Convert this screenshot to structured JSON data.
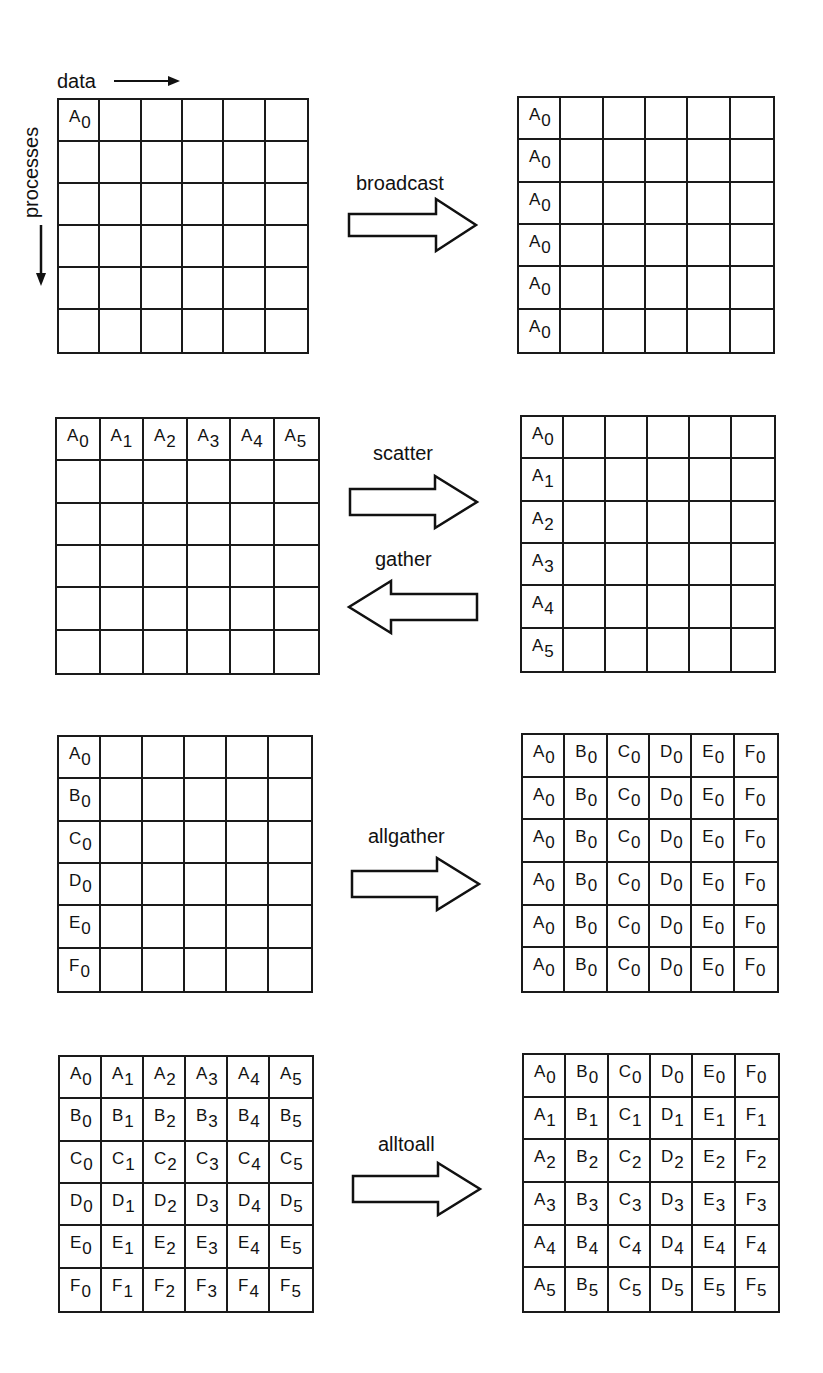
{
  "axes": {
    "data_label": "data",
    "processes_label": "processes"
  },
  "panels": [
    {
      "operation": "broadcast",
      "direction": "right",
      "before": [
        [
          "A0",
          "",
          "",
          "",
          "",
          ""
        ],
        [
          "",
          "",
          "",
          "",
          "",
          ""
        ],
        [
          "",
          "",
          "",
          "",
          "",
          ""
        ],
        [
          "",
          "",
          "",
          "",
          "",
          ""
        ],
        [
          "",
          "",
          "",
          "",
          "",
          ""
        ],
        [
          "",
          "",
          "",
          "",
          "",
          ""
        ]
      ],
      "after": [
        [
          "A0",
          "",
          "",
          "",
          "",
          ""
        ],
        [
          "A0",
          "",
          "",
          "",
          "",
          ""
        ],
        [
          "A0",
          "",
          "",
          "",
          "",
          ""
        ],
        [
          "A0",
          "",
          "",
          "",
          "",
          ""
        ],
        [
          "A0",
          "",
          "",
          "",
          "",
          ""
        ],
        [
          "A0",
          "",
          "",
          "",
          "",
          ""
        ]
      ]
    },
    {
      "operation": "scatter",
      "operation_reverse": "gather",
      "direction": "both",
      "before": [
        [
          "A0",
          "A1",
          "A2",
          "A3",
          "A4",
          "A5"
        ],
        [
          "",
          "",
          "",
          "",
          "",
          ""
        ],
        [
          "",
          "",
          "",
          "",
          "",
          ""
        ],
        [
          "",
          "",
          "",
          "",
          "",
          ""
        ],
        [
          "",
          "",
          "",
          "",
          "",
          ""
        ],
        [
          "",
          "",
          "",
          "",
          "",
          ""
        ]
      ],
      "after": [
        [
          "A0",
          "",
          "",
          "",
          "",
          ""
        ],
        [
          "A1",
          "",
          "",
          "",
          "",
          ""
        ],
        [
          "A2",
          "",
          "",
          "",
          "",
          ""
        ],
        [
          "A3",
          "",
          "",
          "",
          "",
          ""
        ],
        [
          "A4",
          "",
          "",
          "",
          "",
          ""
        ],
        [
          "A5",
          "",
          "",
          "",
          "",
          ""
        ]
      ]
    },
    {
      "operation": "allgather",
      "direction": "right",
      "before": [
        [
          "A0",
          "",
          "",
          "",
          "",
          ""
        ],
        [
          "B0",
          "",
          "",
          "",
          "",
          ""
        ],
        [
          "C0",
          "",
          "",
          "",
          "",
          ""
        ],
        [
          "D0",
          "",
          "",
          "",
          "",
          ""
        ],
        [
          "E0",
          "",
          "",
          "",
          "",
          ""
        ],
        [
          "F0",
          "",
          "",
          "",
          "",
          ""
        ]
      ],
      "after": [
        [
          "A0",
          "B0",
          "C0",
          "D0",
          "E0",
          "F0"
        ],
        [
          "A0",
          "B0",
          "C0",
          "D0",
          "E0",
          "F0"
        ],
        [
          "A0",
          "B0",
          "C0",
          "D0",
          "E0",
          "F0"
        ],
        [
          "A0",
          "B0",
          "C0",
          "D0",
          "E0",
          "F0"
        ],
        [
          "A0",
          "B0",
          "C0",
          "D0",
          "E0",
          "F0"
        ],
        [
          "A0",
          "B0",
          "C0",
          "D0",
          "E0",
          "F0"
        ]
      ]
    },
    {
      "operation": "alltoall",
      "direction": "right",
      "before": [
        [
          "A0",
          "A1",
          "A2",
          "A3",
          "A4",
          "A5"
        ],
        [
          "B0",
          "B1",
          "B2",
          "B3",
          "B4",
          "B5"
        ],
        [
          "C0",
          "C1",
          "C2",
          "C3",
          "C4",
          "C5"
        ],
        [
          "D0",
          "D1",
          "D2",
          "D3",
          "D4",
          "D5"
        ],
        [
          "E0",
          "E1",
          "E2",
          "E3",
          "E4",
          "E5"
        ],
        [
          "F0",
          "F1",
          "F2",
          "F3",
          "F4",
          "F5"
        ]
      ],
      "after": [
        [
          "A0",
          "B0",
          "C0",
          "D0",
          "E0",
          "F0"
        ],
        [
          "A1",
          "B1",
          "C1",
          "D1",
          "E1",
          "F1"
        ],
        [
          "A2",
          "B2",
          "C2",
          "D2",
          "E2",
          "F2"
        ],
        [
          "A3",
          "B3",
          "C3",
          "D3",
          "E3",
          "F3"
        ],
        [
          "A4",
          "B4",
          "C4",
          "D4",
          "E4",
          "F4"
        ],
        [
          "A5",
          "B5",
          "C5",
          "D5",
          "E5",
          "F5"
        ]
      ]
    }
  ]
}
